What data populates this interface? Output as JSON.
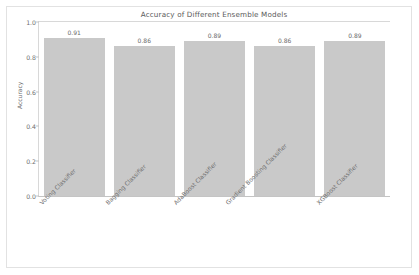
{
  "chart_data": {
    "type": "bar",
    "title": "Accuracy of Different Ensemble Models",
    "xlabel": "",
    "ylabel": "Accuracy",
    "categories": [
      "Voting Classifier",
      "Bagging Classifier",
      "AdaBoost Classifier",
      "Gradient Boosting Classifier",
      "XGBoost Classifier"
    ],
    "values": [
      0.91,
      0.86,
      0.89,
      0.86,
      0.89
    ],
    "value_labels": [
      "0.91",
      "0.86",
      "0.89",
      "0.86",
      "0.89"
    ],
    "ylim": [
      0.0,
      1.0
    ],
    "yticks": [
      "1.0",
      "0.8",
      "0.6",
      "0.4",
      "0.2",
      "0.0"
    ],
    "ytick_values": [
      1.0,
      0.8,
      0.6,
      0.4,
      0.2,
      0.0
    ],
    "grid": false,
    "legend": false,
    "bar_color": "#c9c9c9",
    "background_color": "#ffffff"
  }
}
